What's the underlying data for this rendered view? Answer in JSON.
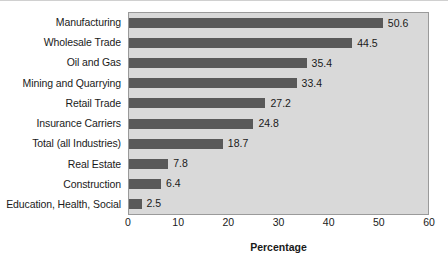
{
  "chart_data": {
    "type": "bar",
    "orientation": "horizontal",
    "title": "",
    "xlabel": "Percentage",
    "ylabel": "",
    "xlim": [
      0,
      60
    ],
    "xticks": [
      0,
      10,
      20,
      30,
      40,
      50,
      60
    ],
    "grid": false,
    "legend": null,
    "bar_color": "#595959",
    "plot_background": "#d9d9d9",
    "categories": [
      "Manufacturing",
      "Wholesale Trade",
      "Oil and Gas",
      "Mining and Quarrying",
      "Retail Trade",
      "Insurance Carriers",
      "Total (all Industries)",
      "Real Estate",
      "Construction",
      "Education, Health, Social"
    ],
    "values": [
      50.6,
      44.5,
      35.4,
      33.4,
      27.2,
      24.8,
      18.7,
      7.8,
      6.4,
      2.5
    ],
    "data_labels": [
      "50.6",
      "44.5",
      "35.4",
      "33.4",
      "27.2",
      "24.8",
      "18.7",
      "7.8",
      "6.4",
      "2.5"
    ],
    "xtick_labels": [
      "0",
      "10",
      "20",
      "30",
      "40",
      "50",
      "60"
    ]
  }
}
